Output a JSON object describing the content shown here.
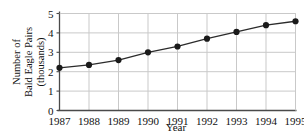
{
  "chart_data": {
    "type": "line",
    "title": "",
    "xlabel": "Year",
    "ylabel": "Number of Bald Eagle Pairs (thousands)",
    "ylabel_lines": [
      "Number of",
      "Bald Eagle Pairs",
      "(thousands)"
    ],
    "categories": [
      "1987",
      "1988",
      "1989",
      "1990",
      "1991",
      "1992",
      "1993",
      "1994",
      "1995"
    ],
    "x": [
      1987,
      1988,
      1989,
      1990,
      1991,
      1992,
      1993,
      1994,
      1995
    ],
    "values": [
      2.2,
      2.35,
      2.6,
      3.0,
      3.3,
      3.7,
      4.05,
      4.4,
      4.6
    ],
    "series": [
      {
        "name": "Bald Eagle Pairs",
        "values": [
          2.2,
          2.35,
          2.6,
          3.0,
          3.3,
          3.7,
          4.05,
          4.4,
          4.6
        ]
      }
    ],
    "xlim": [
      1987,
      1995
    ],
    "ylim": [
      0,
      5
    ],
    "ytick_labels": [
      "0",
      "1",
      "2",
      "3",
      "4",
      "5"
    ],
    "yticks": [
      0,
      1,
      2,
      3,
      4,
      5
    ],
    "xtick_labels": [
      "1987",
      "1988",
      "1989",
      "1990",
      "1991",
      "1992",
      "1993",
      "1994",
      "1995"
    ],
    "grid": true,
    "legend": "none",
    "colors": {
      "line": "#2b2b2b",
      "marker": "#1a1a1a",
      "grid": "#c9c9c9",
      "axis": "#4a4a4a",
      "background": "#ffffff",
      "text": "#111111"
    },
    "marker": "circle",
    "marker_size": 3.1,
    "line_width": 1.3
  }
}
